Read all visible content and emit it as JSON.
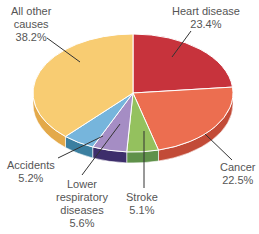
{
  "chart_data": {
    "type": "pie",
    "title": "",
    "style": "3d",
    "slices": [
      {
        "name": "Heart disease",
        "value": 23.4,
        "label": "23.4%",
        "color": "#c7333c",
        "side": "#a0262d"
      },
      {
        "name": "Cancer",
        "value": 22.5,
        "label": "22.5%",
        "color": "#ec6e50",
        "side": "#c24b37"
      },
      {
        "name": "Stroke",
        "value": 5.1,
        "label": "5.1%",
        "color": "#94c15e",
        "side": "#5f914a"
      },
      {
        "name": "Lower respiratory diseases",
        "value": 5.6,
        "label": "5.6%",
        "color": "#a58dc4",
        "side": "#3d2e6b"
      },
      {
        "name": "Accidents",
        "value": 5.2,
        "label": "5.2%",
        "color": "#76b5dc",
        "side": "#3b7fa0"
      },
      {
        "name": "All other causes",
        "value": 38.2,
        "label": "38.2%",
        "color": "#f8cc72",
        "side": "#e3a94a"
      }
    ]
  },
  "labels": {
    "heart": {
      "line1": "Heart disease",
      "line2": "23.4%"
    },
    "cancer": {
      "line1": "Cancer",
      "line2": "22.5%"
    },
    "stroke": {
      "line1": "Stroke",
      "line2": "5.1%"
    },
    "lower": {
      "line1": "Lower",
      "line2": "respiratory",
      "line3": "diseases",
      "line4": "5.6%"
    },
    "accidents": {
      "line1": "Accidents",
      "line2": "5.2%"
    },
    "other": {
      "line1": "All other",
      "line2": "causes",
      "line3": "38.2%"
    }
  }
}
